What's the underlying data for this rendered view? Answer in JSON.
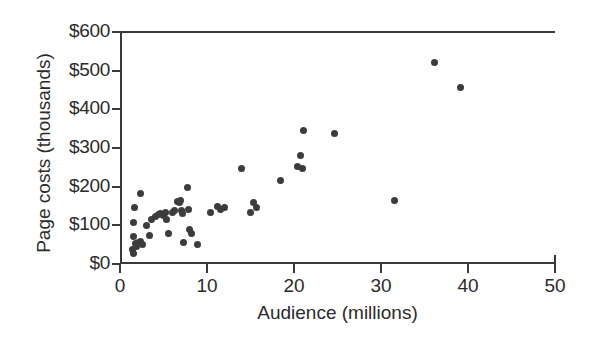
{
  "chart_data": {
    "type": "scatter",
    "title": "",
    "xlabel": "Audience (millions)",
    "ylabel": "Page costs (thousands)",
    "xlim": [
      0,
      50
    ],
    "ylim": [
      0,
      600
    ],
    "xticks": [
      0,
      10,
      20,
      30,
      40,
      50
    ],
    "yticks": [
      0,
      100,
      200,
      300,
      400,
      500,
      600
    ],
    "xtick_labels": [
      "0",
      "10",
      "20",
      "30",
      "40",
      "50"
    ],
    "ytick_labels": [
      "$0",
      "$100",
      "$200",
      "$300",
      "$400",
      "$500",
      "$600"
    ],
    "grid": false,
    "legend": false,
    "marker_color": "#3c3c3c",
    "axis_color": "#3a3a3a",
    "points": [
      {
        "x": 1.4,
        "y": 38
      },
      {
        "x": 1.5,
        "y": 28
      },
      {
        "x": 1.5,
        "y": 72
      },
      {
        "x": 1.6,
        "y": 108
      },
      {
        "x": 1.7,
        "y": 145
      },
      {
        "x": 1.8,
        "y": 52
      },
      {
        "x": 1.9,
        "y": 46
      },
      {
        "x": 2.1,
        "y": 55
      },
      {
        "x": 2.3,
        "y": 57
      },
      {
        "x": 2.4,
        "y": 183
      },
      {
        "x": 2.6,
        "y": 50
      },
      {
        "x": 3.1,
        "y": 100
      },
      {
        "x": 3.4,
        "y": 73
      },
      {
        "x": 3.6,
        "y": 116
      },
      {
        "x": 4.1,
        "y": 122
      },
      {
        "x": 4.4,
        "y": 128
      },
      {
        "x": 4.7,
        "y": 130
      },
      {
        "x": 5.0,
        "y": 126
      },
      {
        "x": 5.2,
        "y": 133
      },
      {
        "x": 5.4,
        "y": 116
      },
      {
        "x": 5.6,
        "y": 80
      },
      {
        "x": 6.0,
        "y": 133
      },
      {
        "x": 6.3,
        "y": 139
      },
      {
        "x": 6.6,
        "y": 162
      },
      {
        "x": 6.8,
        "y": 158
      },
      {
        "x": 6.9,
        "y": 165
      },
      {
        "x": 7.1,
        "y": 138
      },
      {
        "x": 7.2,
        "y": 131
      },
      {
        "x": 7.3,
        "y": 55
      },
      {
        "x": 7.8,
        "y": 198
      },
      {
        "x": 7.9,
        "y": 140
      },
      {
        "x": 8.0,
        "y": 88
      },
      {
        "x": 8.2,
        "y": 80
      },
      {
        "x": 8.9,
        "y": 51
      },
      {
        "x": 10.4,
        "y": 132
      },
      {
        "x": 11.2,
        "y": 148
      },
      {
        "x": 11.6,
        "y": 141
      },
      {
        "x": 12.0,
        "y": 147
      },
      {
        "x": 14.0,
        "y": 247
      },
      {
        "x": 15.0,
        "y": 133
      },
      {
        "x": 15.4,
        "y": 160
      },
      {
        "x": 15.7,
        "y": 147
      },
      {
        "x": 18.5,
        "y": 216
      },
      {
        "x": 20.4,
        "y": 253
      },
      {
        "x": 20.8,
        "y": 280
      },
      {
        "x": 21.0,
        "y": 247
      },
      {
        "x": 21.1,
        "y": 346
      },
      {
        "x": 24.7,
        "y": 338
      },
      {
        "x": 31.6,
        "y": 163
      },
      {
        "x": 36.1,
        "y": 521
      },
      {
        "x": 39.1,
        "y": 457
      }
    ]
  }
}
